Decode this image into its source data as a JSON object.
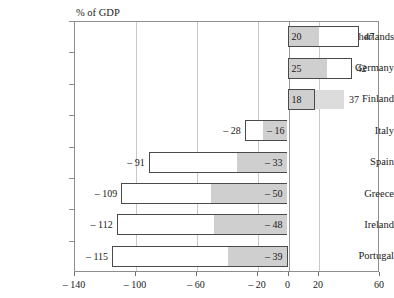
{
  "chart": {
    "axis_caption": "% of GDP",
    "accent_bar_border": "#4a4a4a",
    "accent_fill": "#cfcfcf",
    "accent_ghost": "#dcdcdc",
    "frame_color": "#8d8d8d",
    "grid_color": "#c8c8c8"
  },
  "chart_data": {
    "type": "bar",
    "title": "",
    "subtitle": "",
    "xlabel": "% of GDP",
    "ylabel": "",
    "orientation": "horizontal",
    "grid": true,
    "legend": "none",
    "xlim": [
      -140,
      60
    ],
    "xticks": [
      -140,
      -100,
      -60,
      -20,
      0,
      20,
      60
    ],
    "xtick_labels": [
      "– 140",
      "– 100",
      "– 60",
      "– 20",
      "0",
      "20",
      "60"
    ],
    "categories": [
      "Netherlands",
      "Germany",
      "Finland",
      "Italy",
      "Spain",
      "Greece",
      "Ireland",
      "Portugal"
    ],
    "series": [
      {
        "name": "inner (shaded) component",
        "values": [
          20,
          25,
          18,
          -16,
          -33,
          -50,
          -48,
          -39
        ],
        "labels": [
          "20",
          "25",
          "18",
          "– 16",
          "– 33",
          "– 50",
          "– 48",
          "– 39"
        ]
      },
      {
        "name": "total",
        "values": [
          47,
          42,
          37,
          -28,
          -91,
          -109,
          -112,
          -115
        ],
        "labels": [
          "47",
          "42",
          "37",
          "– 28",
          "– 91",
          "– 109",
          "– 112",
          "– 115"
        ]
      }
    ],
    "bars": [
      {
        "category": "Netherlands",
        "inner": 20,
        "inner_label": "20",
        "total": 47,
        "total_label": "47",
        "style": "outlined"
      },
      {
        "category": "Germany",
        "inner": 25,
        "inner_label": "25",
        "total": 42,
        "total_label": "42",
        "style": "outlined"
      },
      {
        "category": "Finland",
        "inner": 18,
        "inner_label": "18",
        "total": 37,
        "total_label": "37",
        "style": "ghost-extension"
      },
      {
        "category": "Italy",
        "inner": -16,
        "inner_label": "– 16",
        "total": -28,
        "total_label": "– 28",
        "style": "outlined"
      },
      {
        "category": "Spain",
        "inner": -33,
        "inner_label": "– 33",
        "total": -91,
        "total_label": "– 91",
        "style": "outlined"
      },
      {
        "category": "Greece",
        "inner": -50,
        "inner_label": "– 50",
        "total": -109,
        "total_label": "– 109",
        "style": "outlined"
      },
      {
        "category": "Ireland",
        "inner": -48,
        "inner_label": "– 48",
        "total": -112,
        "total_label": "– 112",
        "style": "outlined"
      },
      {
        "category": "Portugal",
        "inner": -39,
        "inner_label": "– 39",
        "total": -115,
        "total_label": "– 115",
        "style": "outlined"
      }
    ]
  }
}
